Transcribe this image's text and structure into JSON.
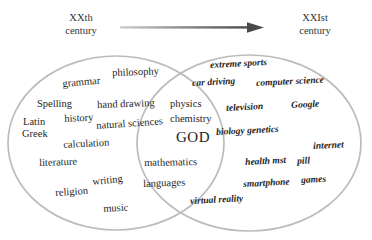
{
  "header": {
    "left_era": {
      "line1": "XXth",
      "line2": "century"
    },
    "right_era": {
      "line1": "XXIst",
      "line2": "century"
    },
    "arrow_name": "time-arrow-right"
  },
  "diagram": {
    "type": "venn-2-set",
    "left_set_label": "XXth century knowledge",
    "right_set_label": "XXIst century knowledge",
    "stroke_color": "#b9b9b9",
    "background_color": "#ffffff",
    "text_color": "#262626"
  },
  "words": {
    "left": [
      {
        "text": "philosophy",
        "x": 112,
        "y": 68,
        "size": 10.5,
        "rot": -2
      },
      {
        "text": "grammar",
        "x": 62,
        "y": 79,
        "size": 10.5,
        "rot": -5
      },
      {
        "text": "Spelling",
        "x": 37,
        "y": 99,
        "size": 10.5,
        "rot": 0
      },
      {
        "text": "hand drawing",
        "x": 97,
        "y": 100,
        "size": 10.5,
        "rot": -2
      },
      {
        "text": "Latin",
        "x": 23,
        "y": 117,
        "size": 10.5,
        "rot": 0
      },
      {
        "text": "history",
        "x": 64,
        "y": 114,
        "size": 10.5,
        "rot": -3
      },
      {
        "text": "natural sciences",
        "x": 96,
        "y": 121,
        "size": 10.5,
        "rot": -4
      },
      {
        "text": "Greek",
        "x": 22,
        "y": 129,
        "size": 10.5,
        "rot": 0
      },
      {
        "text": "calculation",
        "x": 63,
        "y": 140,
        "size": 10.5,
        "rot": -3
      },
      {
        "text": "literature",
        "x": 39,
        "y": 158,
        "size": 10.5,
        "rot": -2
      },
      {
        "text": "writing",
        "x": 92,
        "y": 177,
        "size": 10.5,
        "rot": -6
      },
      {
        "text": "religion",
        "x": 55,
        "y": 188,
        "size": 10.5,
        "rot": -4
      },
      {
        "text": "music",
        "x": 103,
        "y": 204,
        "size": 10.5,
        "rot": -3
      }
    ],
    "center": [
      {
        "text": "physics",
        "x": 170,
        "y": 99,
        "size": 10.5,
        "rot": 0
      },
      {
        "text": "chemistry",
        "x": 170,
        "y": 114,
        "size": 10.5,
        "rot": 0
      },
      {
        "text": "GOD",
        "x": 176,
        "y": 130,
        "size": 15,
        "rot": 0,
        "class": "god"
      },
      {
        "text": "mathematics",
        "x": 144,
        "y": 158,
        "size": 10.5,
        "rot": -1
      },
      {
        "text": "languages",
        "x": 143,
        "y": 179,
        "size": 10.5,
        "rot": -2
      }
    ],
    "right": [
      {
        "text": "extreme sports",
        "x": 210,
        "y": 61,
        "size": 9.5,
        "rot": -3
      },
      {
        "text": "car driving",
        "x": 192,
        "y": 79,
        "size": 9.5,
        "rot": -3
      },
      {
        "text": "computer science",
        "x": 256,
        "y": 79,
        "size": 9.5,
        "rot": -3
      },
      {
        "text": "television",
        "x": 226,
        "y": 104,
        "size": 9.5,
        "rot": -3
      },
      {
        "text": "Google",
        "x": 291,
        "y": 101,
        "size": 9.5,
        "rot": -3
      },
      {
        "text": "biology genetics",
        "x": 216,
        "y": 128,
        "size": 9.5,
        "rot": -3
      },
      {
        "text": "internet",
        "x": 313,
        "y": 142,
        "size": 9.5,
        "rot": -3
      },
      {
        "text": "health mst",
        "x": 245,
        "y": 158,
        "size": 9.5,
        "rot": -3
      },
      {
        "text": "pill",
        "x": 297,
        "y": 157,
        "size": 9.5,
        "rot": -3
      },
      {
        "text": "games",
        "x": 301,
        "y": 176,
        "size": 9.5,
        "rot": -3
      },
      {
        "text": "smartphone",
        "x": 243,
        "y": 180,
        "size": 9.5,
        "rot": -3
      },
      {
        "text": "virtual reality",
        "x": 190,
        "y": 197,
        "size": 9.5,
        "rot": -3
      }
    ]
  }
}
